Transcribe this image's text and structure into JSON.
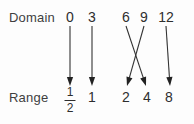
{
  "figure": {
    "domain_label": "Domain",
    "range_label": "Range",
    "background_color": "#fdfdfd",
    "ink_color": "#333333"
  },
  "domain": {
    "values": [
      "0",
      "3",
      "6",
      "9",
      "12"
    ],
    "x": [
      70,
      92,
      126,
      144,
      166
    ]
  },
  "range": {
    "values": [
      "1/2",
      "1",
      "2",
      "4",
      "8"
    ],
    "display": [
      "",
      "1",
      "2",
      "4",
      "8"
    ],
    "x": [
      70,
      92,
      126,
      147,
      169
    ],
    "fraction": {
      "numerator": "1",
      "denominator": "2"
    }
  },
  "mappings": [
    {
      "from": "0",
      "to": "1/2",
      "x1": 70,
      "y1": 26,
      "x2": 70,
      "y2": 86
    },
    {
      "from": "3",
      "to": "1",
      "x1": 92,
      "y1": 26,
      "x2": 92,
      "y2": 86
    },
    {
      "from": "6",
      "to": "4",
      "x1": 126,
      "y1": 26,
      "x2": 146,
      "y2": 86
    },
    {
      "from": "9",
      "to": "2",
      "x1": 144,
      "y1": 26,
      "x2": 127,
      "y2": 86
    },
    {
      "from": "12",
      "to": "8",
      "x1": 166,
      "y1": 26,
      "x2": 170,
      "y2": 86
    }
  ]
}
